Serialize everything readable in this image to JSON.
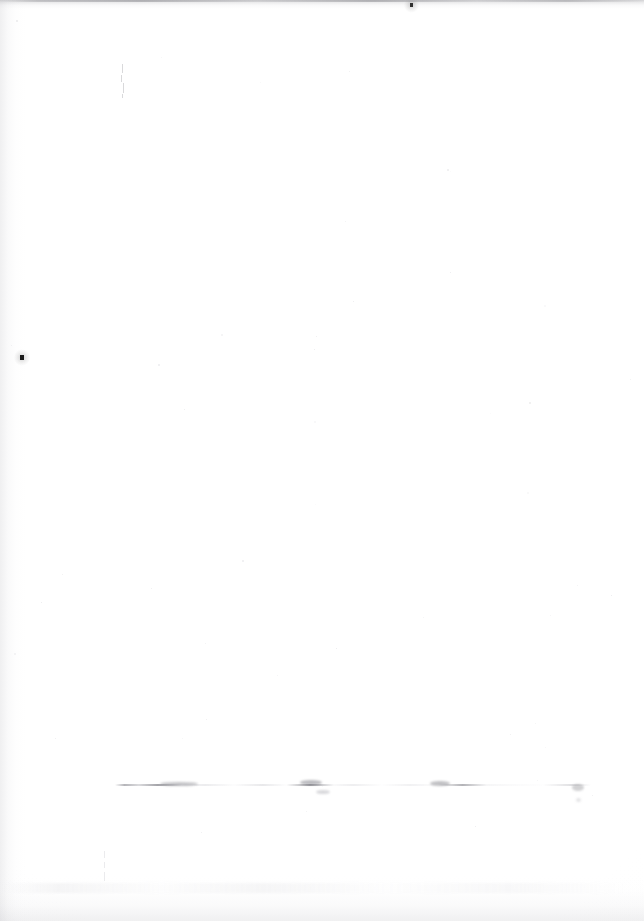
{
  "document": {
    "kind": "scanned-page",
    "title": "Blank scanned page",
    "page_width": 644,
    "page_height": 921,
    "background_color": "#ffffff",
    "text_content": "",
    "has_visible_text": false,
    "description": "A blank white scanned book/document page with no printed text or figures. Only scanning artifacts are visible: a grey shadow band along the top edge, a soft gutter shadow down the left edge, a faint shadow along the bottom edge, a few dark dust specks, and a very faint broken horizontal line of ghosted marks near the lower portion of the page."
  },
  "artifacts": {
    "edges": [
      {
        "name": "top-scan-shadow",
        "edge": "top",
        "thickness": 9,
        "color": "#96969b"
      },
      {
        "name": "left-gutter-shadow",
        "edge": "left",
        "thickness": 26,
        "color": "#b2b2b8"
      },
      {
        "name": "bottom-scan-shadow",
        "edge": "bottom",
        "thickness": 46,
        "color": "#babac0"
      }
    ],
    "ghost_rule": {
      "name": "faint-broken-horizontal-line",
      "x": 115,
      "y": 784,
      "width": 476,
      "height": 2,
      "color": "#6c6c74",
      "note": "broken / dashed remnant line, possibly erased text baseline"
    },
    "ghost_smudges": [
      {
        "x": 160,
        "y": 782,
        "w": 38,
        "h": 4,
        "color": "rgba(110,110,118,0.40)"
      },
      {
        "x": 300,
        "y": 780,
        "w": 22,
        "h": 5,
        "color": "rgba(96,96,104,0.42)"
      },
      {
        "x": 316,
        "y": 790,
        "w": 14,
        "h": 4,
        "color": "rgba(130,130,138,0.30)"
      },
      {
        "x": 430,
        "y": 781,
        "w": 20,
        "h": 5,
        "color": "rgba(100,100,108,0.40)"
      },
      {
        "x": 572,
        "y": 784,
        "w": 12,
        "h": 7,
        "color": "rgba(122,122,130,0.34)"
      },
      {
        "x": 576,
        "y": 798,
        "w": 5,
        "h": 4,
        "color": "rgba(150,150,158,0.26)"
      }
    ],
    "specks": [
      {
        "name": "dark-speck-left",
        "x": 20,
        "y": 355,
        "w": 4,
        "h": 5,
        "color": "#1b1b1b"
      },
      {
        "name": "dark-speck-top",
        "x": 410,
        "y": 3,
        "w": 3,
        "h": 4,
        "color": "#303030"
      }
    ],
    "pen_mark": {
      "name": "faint-vertical-pen-stroke",
      "x": 121,
      "y": 64,
      "height": 32,
      "color": "#808088"
    },
    "flecks_count": 46
  }
}
